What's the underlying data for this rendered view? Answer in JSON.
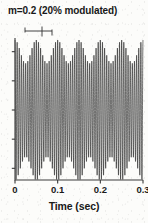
{
  "figure": {
    "title": "m=0.2 (20% modulated)",
    "xlabel": "Time (sec)",
    "axis_color": "#3a3a3a",
    "trace_color": "#1a1a1a",
    "background": "#fcfcfa"
  },
  "annotation": {
    "name": "interval-caliper-marker",
    "description": "small horizontal bar with end ticks and a center tick above the waveform"
  },
  "chart_data": {
    "type": "line",
    "title": "m=0.2 (20% modulated)",
    "subtitle": "",
    "xlabel": "Time (sec)",
    "ylabel": "",
    "xlim": [
      0,
      0.3
    ],
    "ylim": [
      -1.2,
      1.2
    ],
    "xticks": [
      0,
      0.1,
      0.2,
      0.3
    ],
    "xticklabels": [
      "0",
      "0.1",
      "0.2",
      "0.3"
    ],
    "yticks": [
      -1.0,
      -0.5,
      0,
      0.5,
      1.0
    ],
    "yticklabels": [
      "",
      "",
      "",
      "",
      ""
    ],
    "grid": false,
    "legend": null,
    "modulation_index": 0.2,
    "modulation_percent": 20,
    "carrier_frequency_hz": 200,
    "modulation_frequency_hz": 20,
    "series": [
      {
        "name": "AM signal",
        "equation": "y(t) = (1 + 0.2*cos(2*pi*20*t)) * cos(2*pi*200*t)",
        "color": "#1a1a1a"
      },
      {
        "name": "upper envelope",
        "equation": "e(t) = 1 + 0.2*cos(2*pi*20*t)",
        "color": "#1a1a1a"
      },
      {
        "name": "lower envelope",
        "equation": "e(t) = -(1 + 0.2*cos(2*pi*20*t))",
        "color": "#1a1a1a"
      }
    ]
  }
}
